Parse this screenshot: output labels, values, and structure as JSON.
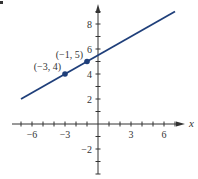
{
  "chart_data": {
    "type": "line",
    "title": "",
    "xlabel": "x",
    "ylabel": "",
    "xlim": [
      -7,
      7
    ],
    "ylim": [
      -4,
      9.5
    ],
    "grid": false,
    "x_ticks": [
      -6,
      -3,
      3,
      6
    ],
    "x_tick_labels": [
      "−6",
      "−3",
      "3",
      "6"
    ],
    "y_ticks": [
      -2,
      2,
      4,
      6,
      8
    ],
    "y_tick_labels": [
      "−2",
      "2",
      "4",
      "6",
      "8"
    ],
    "series": [
      {
        "name": "line",
        "equation": "y = 0.5x + 5.5",
        "x": [
          -7,
          7
        ],
        "y": [
          2,
          9
        ]
      }
    ],
    "points": [
      {
        "x": -3,
        "y": 4,
        "label": "(−3, 4)"
      },
      {
        "x": -1,
        "y": 5,
        "label": "(−1, 5)"
      }
    ],
    "colors": {
      "line": "#1f3f7a",
      "axis": "#333333"
    }
  }
}
